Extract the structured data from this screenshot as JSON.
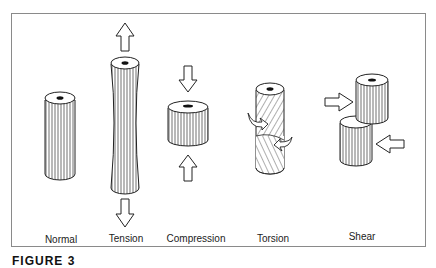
{
  "figure": {
    "caption": "FIGURE 3",
    "panels": [
      {
        "id": "normal",
        "label": "Normal",
        "label_x": 61,
        "label_y": 234
      },
      {
        "id": "tension",
        "label": "Tension",
        "label_x": 126,
        "label_y": 233
      },
      {
        "id": "compression",
        "label": "Compression",
        "label_x": 196,
        "label_y": 233
      },
      {
        "id": "torsion",
        "label": "Torsion",
        "label_x": 273,
        "label_y": 233
      },
      {
        "id": "shear",
        "label": "Shear",
        "label_x": 362,
        "label_y": 231
      }
    ]
  }
}
